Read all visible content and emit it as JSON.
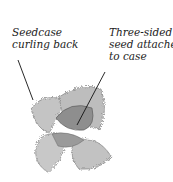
{
  "labels": [
    {
      "line1": "Seedcase",
      "line2": "curling back"
    },
    {
      "line1": "Three-sided",
      "line2": "seed attached",
      "line3": "to case"
    }
  ],
  "colors": {
    "text": "#222222",
    "seedcase": "#b8b8b8",
    "seed": "#8e8e8e",
    "background": "#ffffff"
  }
}
